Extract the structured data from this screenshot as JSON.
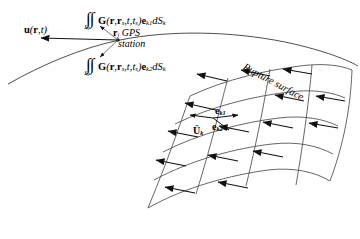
{
  "figure": {
    "domain": "seismology-source-inversion-diagram",
    "background_color": "#ffffff",
    "line_color": "#1a1a1a",
    "width": 360,
    "height": 239
  },
  "ground_surface": {
    "name": "earth-surface-curve",
    "description": "curved free surface line passing through GPS station"
  },
  "displacement": {
    "label_prefix": "u",
    "label_args": "(r,t)",
    "full": "u(r,t)",
    "arrow_direction": "left"
  },
  "station": {
    "symbol": "r",
    "subscript": "j",
    "line1": "GPS",
    "line2": "station"
  },
  "integrals": [
    {
      "id": "green-integral-e-k1",
      "int_symbol": "∫∫",
      "domain_sub": "S",
      "domain_sub_sub": "k",
      "kernel": "G",
      "args": "(r,r",
      "args_sub1": "s",
      "args_mid": ",t,t",
      "args_sub2": "s",
      "args_end": ")",
      "basis": "e",
      "basis_sub": "k1",
      "measure": "dS",
      "measure_sub": "k",
      "plain": "∫∫Sk G(r,rs,t,ts)ek1 dSk"
    },
    {
      "id": "green-integral-e-k2",
      "int_symbol": "∫∫",
      "domain_sub": "S",
      "domain_sub_sub": "k",
      "kernel": "G",
      "args": "(r,r",
      "args_sub1": "s",
      "args_mid": ",t,t",
      "args_sub2": "s",
      "args_end": ")",
      "basis": "e",
      "basis_sub": "k2",
      "measure": "dS",
      "measure_sub": "k",
      "plain": "∫∫Sk G(r,rs,t,ts)ek2 dSk"
    }
  ],
  "fault": {
    "title": "Rupture surface",
    "mesh_rows": 4,
    "mesh_cols": 4,
    "slip_arrow_direction": "left",
    "slip_arrow_count": 14,
    "basis_vectors": [
      {
        "symbol": "e",
        "subscript": "k1",
        "direction": "right"
      },
      {
        "symbol": "e",
        "subscript": "k2",
        "direction": "down-right"
      }
    ],
    "slip_rate_vector": {
      "symbol": "U",
      "accent": "double-dot",
      "subscript": "k",
      "direction": "left"
    }
  }
}
